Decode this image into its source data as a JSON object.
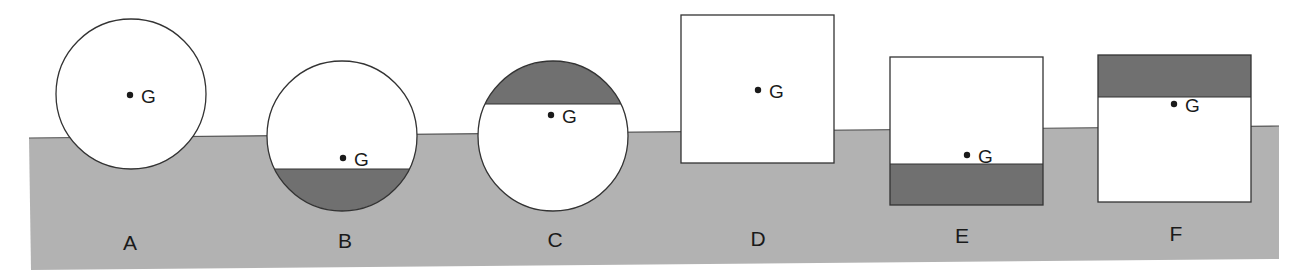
{
  "diagram": {
    "colors": {
      "background": "#ffffff",
      "water": "#b2b2b2",
      "water_edge": "#555555",
      "body_fill": "#ffffff",
      "ballast": "#707070",
      "outline": "#333333",
      "text": "#1a1a1a"
    },
    "water": {
      "points": "29,138 1279,126 1279,259 31,270"
    },
    "cog_label": "G",
    "bodies": [
      {
        "id": "A",
        "label": "A",
        "shape": "circle",
        "cx": 131,
        "cy": 94,
        "r": 75,
        "ballast": "none",
        "g": [
          130,
          95
        ],
        "label_pos": [
          130,
          250
        ]
      },
      {
        "id": "B",
        "label": "B",
        "shape": "circle",
        "cx": 342,
        "cy": 136,
        "r": 75,
        "ballast": "bottom",
        "ballast_chord_y": 169,
        "g": [
          343,
          158
        ],
        "label_pos": [
          345,
          248
        ]
      },
      {
        "id": "C",
        "label": "C",
        "shape": "circle",
        "cx": 553,
        "cy": 136,
        "r": 75,
        "ballast": "top",
        "ballast_chord_y": 104,
        "g": [
          551,
          115
        ],
        "label_pos": [
          555,
          247
        ]
      },
      {
        "id": "D",
        "label": "D",
        "shape": "rect",
        "x": 681,
        "y": 15,
        "w": 153,
        "h": 148,
        "ballast": "none",
        "g": [
          758,
          90
        ],
        "label_pos": [
          758,
          246
        ]
      },
      {
        "id": "E",
        "label": "E",
        "shape": "rect",
        "x": 890,
        "y": 57,
        "w": 153,
        "h": 148,
        "ballast": "bottom",
        "ballast_edge_y": 164,
        "g": [
          967,
          155
        ],
        "label_pos": [
          962,
          243
        ]
      },
      {
        "id": "F",
        "label": "F",
        "shape": "rect",
        "x": 1098,
        "y": 55,
        "w": 153,
        "h": 147,
        "ballast": "top",
        "ballast_edge_y": 97,
        "g": [
          1174,
          104
        ],
        "label_pos": [
          1176,
          241
        ]
      }
    ]
  }
}
